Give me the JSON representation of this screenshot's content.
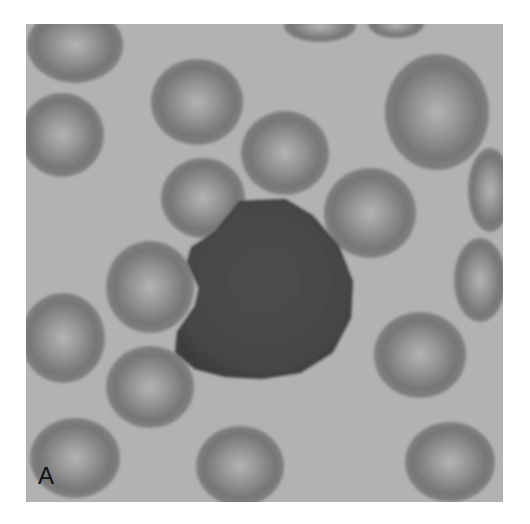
{
  "figure": {
    "panel_label": "A",
    "colors": {
      "page_background": "#ffffff",
      "smear_background": "#b2b2b2",
      "rbc_rim": "#6e6e6e",
      "rbc_center": "#a8a8a8",
      "lymphocyte": "#4a4a4a"
    },
    "frame": {
      "x": 26,
      "y": 24,
      "width": 477,
      "height": 478
    },
    "red_cells": [
      {
        "cx": 75,
        "cy": 45,
        "rx": 48,
        "ry": 38
      },
      {
        "cx": 62,
        "cy": 135,
        "rx": 42,
        "ry": 42
      },
      {
        "cx": 197,
        "cy": 102,
        "rx": 46,
        "ry": 43
      },
      {
        "cx": 285,
        "cy": 153,
        "rx": 44,
        "ry": 42
      },
      {
        "cx": 203,
        "cy": 198,
        "rx": 42,
        "ry": 40
      },
      {
        "cx": 370,
        "cy": 213,
        "rx": 46,
        "ry": 45
      },
      {
        "cx": 437,
        "cy": 112,
        "rx": 52,
        "ry": 58
      },
      {
        "cx": 490,
        "cy": 190,
        "rx": 22,
        "ry": 42
      },
      {
        "cx": 150,
        "cy": 287,
        "rx": 44,
        "ry": 46
      },
      {
        "cx": 480,
        "cy": 280,
        "rx": 26,
        "ry": 42
      },
      {
        "cx": 63,
        "cy": 338,
        "rx": 42,
        "ry": 45
      },
      {
        "cx": 420,
        "cy": 355,
        "rx": 46,
        "ry": 43
      },
      {
        "cx": 150,
        "cy": 387,
        "rx": 44,
        "ry": 41
      },
      {
        "cx": 75,
        "cy": 458,
        "rx": 45,
        "ry": 40
      },
      {
        "cx": 240,
        "cy": 466,
        "rx": 44,
        "ry": 40
      },
      {
        "cx": 450,
        "cy": 462,
        "rx": 45,
        "ry": 40
      },
      {
        "cx": 320,
        "cy": 26,
        "rx": 36,
        "ry": 16
      },
      {
        "cx": 396,
        "cy": 24,
        "rx": 28,
        "ry": 14
      }
    ],
    "lymphocyte_path": "M240,202 L285,200 L312,216 L338,246 L352,282 L350,318 L332,352 L300,372 L262,378 L225,376 L195,368 L176,352 L178,332 L196,306 L200,288 L188,262 L192,248 L216,232 Z"
  }
}
